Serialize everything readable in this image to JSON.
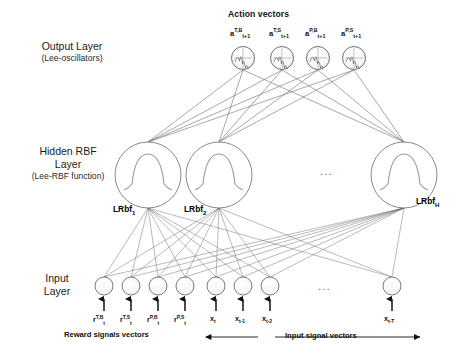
{
  "figure": {
    "type": "neural-network-architecture",
    "background": "#ffffff",
    "line_color": "#555555",
    "node_stroke": "#4a4a4a"
  },
  "titles": {
    "action_vectors": "Action vectors",
    "reward_signals": "Reward signals vectors",
    "input_signals": "Input signal vectors"
  },
  "layers": {
    "output": {
      "name": "Output Layer",
      "sublabel": "(Lee-oscillators)",
      "glyph": "lee-oscillator-waveform",
      "nodes": [
        {
          "base": "a",
          "sup": "T,B",
          "sub": "t+1"
        },
        {
          "base": "a",
          "sup": "T,S",
          "sub": "t+1"
        },
        {
          "base": "a",
          "sup": "P,B",
          "sub": "t+1"
        },
        {
          "base": "a",
          "sup": "P,S",
          "sub": "t+1"
        }
      ]
    },
    "hidden": {
      "name": "Hidden RBF",
      "name2": "Layer",
      "sublabel": "(Lee-RBF function)",
      "glyph": "lee-rbf-bell-curve",
      "ellipsis": "...",
      "nodes": [
        {
          "base": "LRbf",
          "sub": "1"
        },
        {
          "base": "LRbf",
          "sub": "2"
        },
        {
          "base": "LRbf",
          "sub": "H"
        }
      ]
    },
    "input": {
      "name": "Input",
      "name2": "Layer",
      "ellipsis": "...",
      "nodes": [
        {
          "base": "r",
          "sup": "T,B",
          "sub": "t",
          "group": "reward"
        },
        {
          "base": "r",
          "sup": "T,S",
          "sub": "t",
          "group": "reward"
        },
        {
          "base": "r",
          "sup": "P,B",
          "sub": "t",
          "group": "reward"
        },
        {
          "base": "r",
          "sup": "P,S",
          "sub": "t",
          "group": "reward"
        },
        {
          "base": "x",
          "sup": "",
          "sub": "t",
          "group": "signal"
        },
        {
          "base": "x",
          "sup": "",
          "sub": "t-1",
          "group": "signal"
        },
        {
          "base": "x",
          "sup": "",
          "sub": "t-2",
          "group": "signal"
        },
        {
          "base": "x",
          "sup": "",
          "sub": "t-T",
          "group": "signal"
        }
      ]
    }
  }
}
